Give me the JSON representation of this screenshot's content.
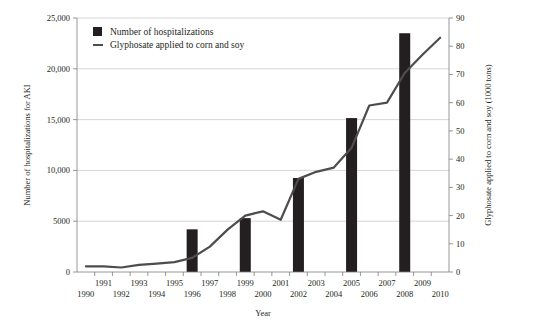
{
  "chart_data": {
    "type": "bar",
    "title": "",
    "subtitle": "",
    "xlabel": "Year",
    "ylabel": "Number of hospitalizations for AKI",
    "y2label": "Glyphosate applied to corn and soy (1000 tons)",
    "grid": true,
    "legend_position": "top-left",
    "xlim": [
      1989.5,
      2010.5
    ],
    "ylim": [
      0,
      25000
    ],
    "y2lim": [
      0,
      90
    ],
    "x_tick_labels": [
      "1990",
      "1991",
      "1992",
      "1993",
      "1994",
      "1995",
      "1996",
      "1997",
      "1998",
      "1999",
      "2000",
      "2001",
      "2002",
      "2003",
      "2004",
      "2005",
      "2006",
      "2007",
      "2008",
      "2009",
      "2010"
    ],
    "y_tick_labels": [
      "0",
      "5000",
      "10,000",
      "15,000",
      "20,000",
      "25,000"
    ],
    "y_tick_values": [
      0,
      5000,
      10000,
      15000,
      20000,
      25000
    ],
    "y2_tick_labels": [
      "0",
      "10",
      "20",
      "30",
      "40",
      "50",
      "60",
      "70",
      "80",
      "90"
    ],
    "y2_tick_values": [
      0,
      10,
      20,
      30,
      40,
      50,
      60,
      70,
      80,
      90
    ],
    "series": [
      {
        "name": "Number of hospitalizations",
        "type": "bar",
        "axis": "left",
        "color": "#231f20",
        "x": [
          1996,
          1999,
          2002,
          2005,
          2008
        ],
        "values": [
          4200,
          5300,
          9250,
          15150,
          23500
        ]
      },
      {
        "name": "Glyphosate applied to corn and soy",
        "type": "line",
        "axis": "right",
        "color": "#4d4d4d",
        "x": [
          1990,
          1991,
          1992,
          1993,
          1994,
          1995,
          1996,
          1997,
          1998,
          1999,
          2000,
          2001,
          2002,
          2003,
          2004,
          2005,
          2006,
          2007,
          2008,
          2009,
          2010
        ],
        "values": [
          2.0,
          2.0,
          1.6,
          2.5,
          3.0,
          3.5,
          5.0,
          9.0,
          15.0,
          20.0,
          21.5,
          18.5,
          33.0,
          35.5,
          37.0,
          44.0,
          59.0,
          60.0,
          70.5,
          77.0,
          83.0
        ]
      }
    ]
  },
  "legend": {
    "items": [
      {
        "label": "Number of hospitalizations",
        "marker": "square",
        "color": "#231f20"
      },
      {
        "label": "Glyphosate applied to corn and soy",
        "marker": "line",
        "color": "#4d4d4d"
      }
    ]
  }
}
